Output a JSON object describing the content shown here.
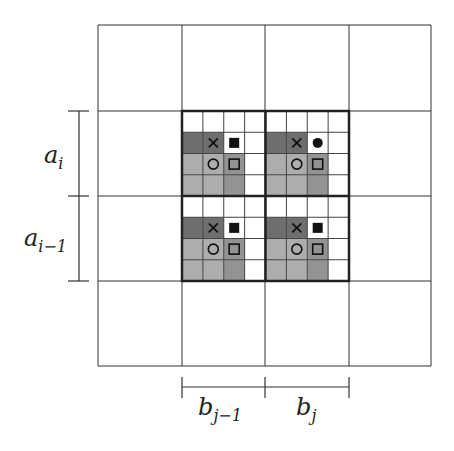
{
  "figure": {
    "outer_grid": {
      "cols": 4,
      "rows": 4,
      "x": [
        98,
        182,
        265,
        349,
        431
      ],
      "y": [
        25,
        111,
        196,
        281,
        366
      ]
    },
    "highlight_region": {
      "x0": 182,
      "y0": 111,
      "x1": 349,
      "y1": 281
    },
    "subgrid_per_block": 4,
    "colors": {
      "dark": "#6e6e6e",
      "mid": "#939393",
      "light": "#adadad",
      "white": "#ffffff",
      "line": "#333333"
    },
    "block_pattern": [
      [
        "white",
        "white",
        "white",
        "white"
      ],
      [
        "dark",
        "dark",
        "white",
        "white"
      ],
      [
        "light",
        "light",
        "mid",
        "white"
      ],
      [
        "light",
        "light",
        "mid",
        "white"
      ]
    ],
    "blocks": [
      {
        "row": 0,
        "col": 0,
        "symbol_filled": "square"
      },
      {
        "row": 0,
        "col": 1,
        "symbol_filled": "circle"
      },
      {
        "row": 1,
        "col": 0,
        "symbol_filled": "square"
      },
      {
        "row": 1,
        "col": 1,
        "symbol_filled": "square"
      }
    ],
    "symbols": {
      "cross": "×",
      "open_circle": "○",
      "open_square": "□"
    }
  },
  "labels": {
    "a_i": {
      "base": "a",
      "sub": "i"
    },
    "a_i_minus_1": {
      "base": "a",
      "sub": "i−1"
    },
    "b_j_minus_1": {
      "base": "b",
      "sub": "j−1"
    },
    "b_j": {
      "base": "b",
      "sub": "j"
    }
  }
}
